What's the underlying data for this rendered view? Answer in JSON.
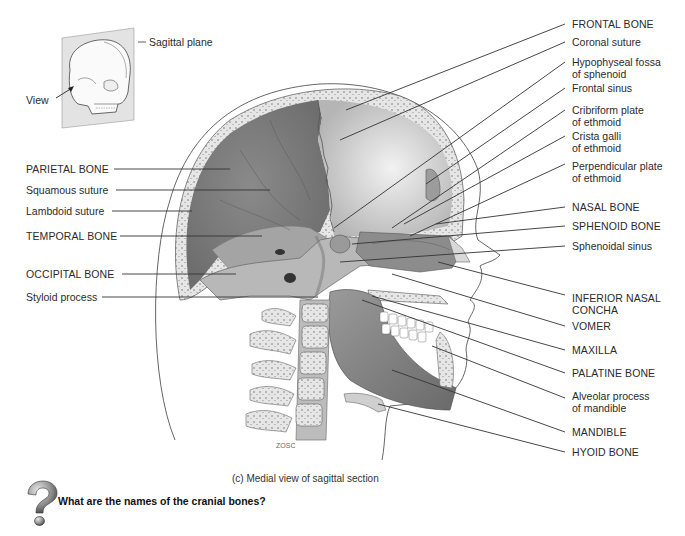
{
  "figure": {
    "caption": "(c) Medial view of sagittal section",
    "question": "What are the names of the cranial bones?",
    "question_icon": "question-mark-icon",
    "signature": "ZOSC"
  },
  "inset": {
    "labels": {
      "sagittal_plane": "Sagittal\nplane",
      "view": "View"
    }
  },
  "labels_left": [
    {
      "text": "PARIETAL BONE",
      "caps": true
    },
    {
      "text": "Squamous suture",
      "caps": false
    },
    {
      "text": "Lambdoid suture",
      "caps": false
    },
    {
      "text": "TEMPORAL BONE",
      "caps": true
    },
    {
      "text": "OCCIPITAL BONE",
      "caps": true
    },
    {
      "text": "Styloid process",
      "caps": false
    }
  ],
  "labels_right": [
    {
      "text": "FRONTAL BONE",
      "caps": true
    },
    {
      "text": "Coronal suture",
      "caps": false
    },
    {
      "text": "Hypophyseal fossa\nof sphenoid",
      "caps": false
    },
    {
      "text": "Frontal sinus",
      "caps": false
    },
    {
      "text": "Cribriform plate\nof ethmoid",
      "caps": false
    },
    {
      "text": "Crista galli\nof ethmoid",
      "caps": false
    },
    {
      "text": "Perpendicular plate\nof ethmoid",
      "caps": false
    },
    {
      "text": "NASAL BONE",
      "caps": true
    },
    {
      "text": "SPHENOID BONE",
      "caps": true
    },
    {
      "text": "Sphenoidal sinus",
      "caps": false
    },
    {
      "text": "INFERIOR NASAL\nCONCHA",
      "caps": true
    },
    {
      "text": "VOMER",
      "caps": true
    },
    {
      "text": "MAXILLA",
      "caps": true
    },
    {
      "text": "PALATINE BONE",
      "caps": true
    },
    {
      "text": "Alveolar process\nof mandible",
      "caps": false
    },
    {
      "text": "MANDIBLE",
      "caps": true
    },
    {
      "text": "HYOID BONE",
      "caps": true
    }
  ],
  "colors": {
    "background": "#ffffff",
    "text": "#2b2b2b",
    "leader_line": "#333333",
    "bone_dark": "#7d7d7d",
    "bone_mid": "#a9a9a9",
    "bone_light": "#d6d6d6",
    "cranial_cavity_frontal": "#c8c8c8",
    "skin_outline": "#555555"
  }
}
